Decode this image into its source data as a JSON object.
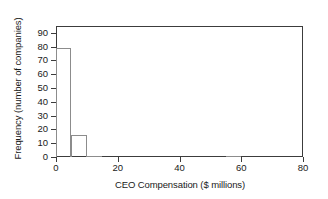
{
  "chart_data": {
    "type": "bar",
    "title": "",
    "subtitle": "",
    "xlabel": "CEO Compensation ($ millions)",
    "ylabel": "Frequency (number of companies)",
    "xlim": [
      0,
      80
    ],
    "ylim": [
      0,
      95
    ],
    "xticks": [
      0,
      20,
      40,
      60,
      80
    ],
    "xtick_labels": [
      "0",
      "20",
      "40",
      "60",
      "80"
    ],
    "yticks": [
      0,
      10,
      20,
      30,
      40,
      50,
      60,
      70,
      80,
      90
    ],
    "ytick_labels": [
      "0",
      "10",
      "20",
      "30",
      "40",
      "50",
      "60",
      "70",
      "80",
      "90"
    ],
    "grid": false,
    "legend": null,
    "bin_width": 5,
    "bins": [
      {
        "x0": 0,
        "x1": 5,
        "value": 79
      },
      {
        "x0": 5,
        "x1": 10,
        "value": 16
      },
      {
        "x0": 10,
        "x1": 15,
        "value": 1
      },
      {
        "x0": 15,
        "x1": 20,
        "value": 0
      },
      {
        "x0": 20,
        "x1": 25,
        "value": 0
      },
      {
        "x0": 25,
        "x1": 30,
        "value": 0
      },
      {
        "x0": 30,
        "x1": 35,
        "value": 0
      },
      {
        "x0": 35,
        "x1": 40,
        "value": 0
      },
      {
        "x0": 40,
        "x1": 45,
        "value": 0
      },
      {
        "x0": 45,
        "x1": 50,
        "value": 0
      },
      {
        "x0": 50,
        "x1": 55,
        "value": 0
      },
      {
        "x0": 55,
        "x1": 60,
        "value": 1
      },
      {
        "x0": 60,
        "x1": 65,
        "value": 0
      },
      {
        "x0": 65,
        "x1": 70,
        "value": 0
      },
      {
        "x0": 70,
        "x1": 75,
        "value": 0
      },
      {
        "x0": 75,
        "x1": 80,
        "value": 0
      }
    ],
    "categories": [
      "0-5",
      "5-10",
      "10-15",
      "15-20",
      "20-25",
      "25-30",
      "30-35",
      "35-40",
      "40-45",
      "45-50",
      "50-55",
      "55-60",
      "60-65",
      "65-70",
      "70-75",
      "75-80"
    ],
    "values": [
      79,
      16,
      1,
      0,
      0,
      0,
      0,
      0,
      0,
      0,
      0,
      1,
      0,
      0,
      0,
      0
    ],
    "colors": {
      "bar_edge": "#8c8c8c",
      "bar_fill": "transparent",
      "axis": "#3c3c3c",
      "text": "#1a1a1a",
      "background": "#ffffff"
    }
  }
}
